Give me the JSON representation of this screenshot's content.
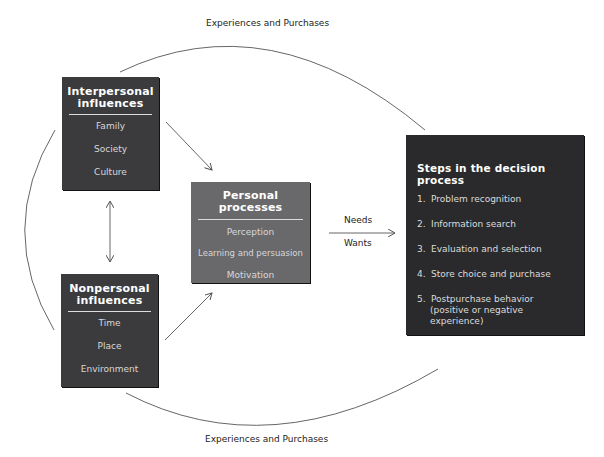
{
  "diagram": {
    "top_arc_label": "Experiences and Purchases",
    "bottom_arc_label": "Experiences and Purchases",
    "interpersonal": {
      "title_line1": "Interpersonal",
      "title_line2": "influences",
      "items": [
        "Family",
        "Society",
        "Culture"
      ]
    },
    "nonpersonal": {
      "title_line1": "Nonpersonal",
      "title_line2": "influences",
      "items": [
        "Time",
        "Place",
        "Environment"
      ]
    },
    "personal": {
      "title": "Personal processes",
      "items": [
        "Perception",
        "Learning and persuasion",
        "Motivation"
      ]
    },
    "arrow_labels": {
      "above": "Needs",
      "below": "Wants"
    },
    "steps": {
      "title": "Steps in the decision process",
      "items": [
        {
          "num": "1.",
          "text": "Problem recognition"
        },
        {
          "num": "2.",
          "text": "Information search"
        },
        {
          "num": "3.",
          "text": "Evaluation and selection"
        },
        {
          "num": "4.",
          "text": "Store choice and purchase"
        },
        {
          "num": "5.",
          "text": "Postpurchase behavior",
          "text2": "(positive or negative experience)"
        }
      ]
    },
    "colors": {
      "interpersonal_box": "#3b3b3d",
      "nonpersonal_box": "#3b3b3d",
      "personal_box": "#69696c",
      "steps_box": "#2a2a2c",
      "lines": "#555555"
    }
  }
}
